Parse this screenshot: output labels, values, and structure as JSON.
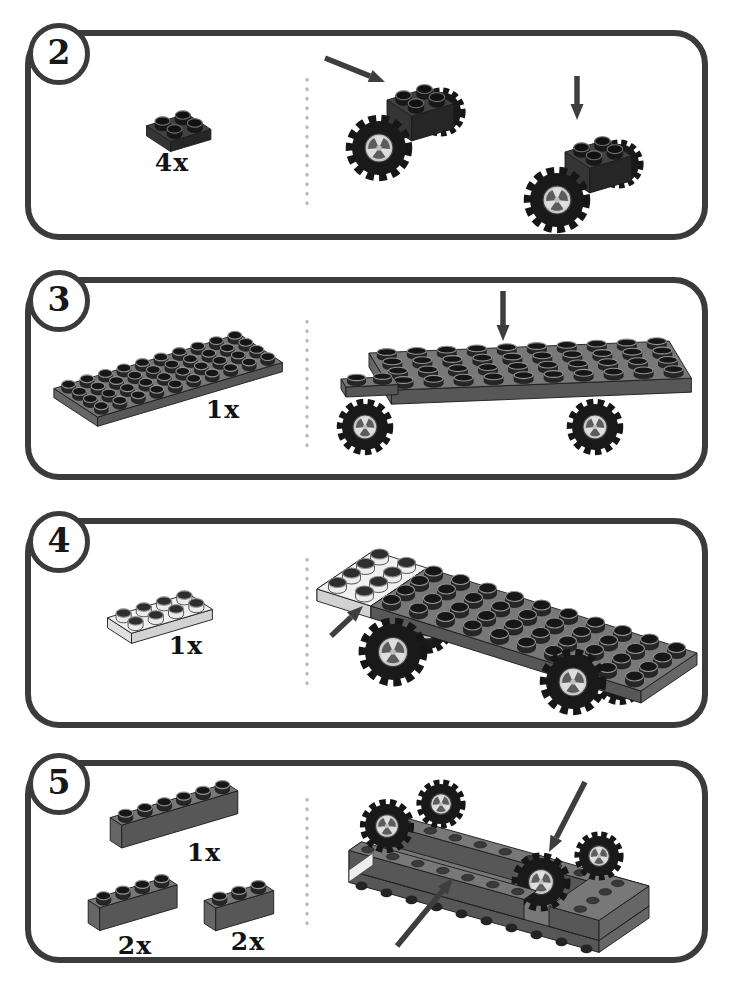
{
  "page": {
    "background": "#ffffff",
    "panel_border_color": "#3b3b3b",
    "divider_dot_color": "#bcbcbc",
    "arrow_color": "#3e3e3e",
    "text_color": "#131313"
  },
  "palette": {
    "dark": {
      "top": "#424242",
      "front": "#262626",
      "side": "#353535",
      "studSide": "#171717",
      "studTop": "#111111",
      "rim": "#707070"
    },
    "gray": {
      "top": "#787878",
      "front": "#575757",
      "side": "#666666",
      "studSide": "#262626",
      "studTop": "#161616",
      "rim": "#949494"
    },
    "white": {
      "top": "#f0f0f0",
      "front": "#d2d2d2",
      "side": "#e0e0e0",
      "studSide": "#ececec",
      "studTop": "#2e2e2e",
      "rim": "#8d8d8d"
    }
  },
  "steps": [
    {
      "number": "2",
      "parts": [
        {
          "piece": "plate-2x2-dark-gray",
          "qty": "4x",
          "type": "plate",
          "cols": 2,
          "rows": 2,
          "color": "dark"
        }
      ],
      "scene": {
        "name": "attach-2x2-plates-to-wheel-assemblies",
        "arrows": [
          "diagonal-down-right",
          "straight-down"
        ]
      }
    },
    {
      "number": "3",
      "parts": [
        {
          "piece": "plate-4x10-gray",
          "qty": "1x",
          "type": "plate",
          "cols": 10,
          "rows": 4,
          "color": "gray"
        }
      ],
      "scene": {
        "name": "place-4x10-plate-onto-wheel-assemblies",
        "arrows": [
          "straight-down"
        ]
      }
    },
    {
      "number": "4",
      "parts": [
        {
          "piece": "plate-2x4-white",
          "qty": "1x",
          "type": "plate",
          "cols": 4,
          "rows": 2,
          "color": "white"
        }
      ],
      "scene": {
        "name": "attach-white-2x4-plate-at-front",
        "arrows": [
          "diagonal-up-right"
        ]
      }
    },
    {
      "number": "5",
      "parts": [
        {
          "piece": "brick-1x6-gray",
          "qty": "1x",
          "type": "brick",
          "cols": 6,
          "rows": 1,
          "color": "gray"
        },
        {
          "piece": "brick-1x4-gray",
          "qty": "2x",
          "type": "brick",
          "cols": 4,
          "rows": 1,
          "color": "gray"
        },
        {
          "piece": "brick-1x3-gray",
          "qty": "2x",
          "type": "brick",
          "cols": 3,
          "rows": 1,
          "color": "gray"
        }
      ],
      "scene": {
        "name": "flipped-chassis-attach-bricks-to-underside",
        "arrows": [
          "diagonal-down-left",
          "diagonal-up-right"
        ]
      }
    }
  ]
}
